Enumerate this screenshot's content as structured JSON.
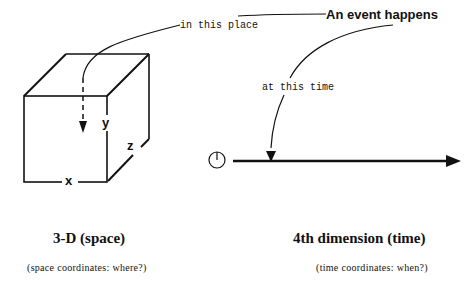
{
  "event": {
    "headline": "An event happens",
    "place_label": "in this place",
    "time_label": "at this time"
  },
  "space": {
    "axes": {
      "x": "x",
      "y": "y",
      "z": "z"
    },
    "title": "3-D (space)",
    "subtitle": "(space  coordinates:  where?)"
  },
  "time": {
    "title": "4th dimension (time)",
    "subtitle": "(time  coordinates:  when?)",
    "start_icon": "clock-icon"
  },
  "colors": {
    "ink": "#111111",
    "background": "#ffffff"
  }
}
